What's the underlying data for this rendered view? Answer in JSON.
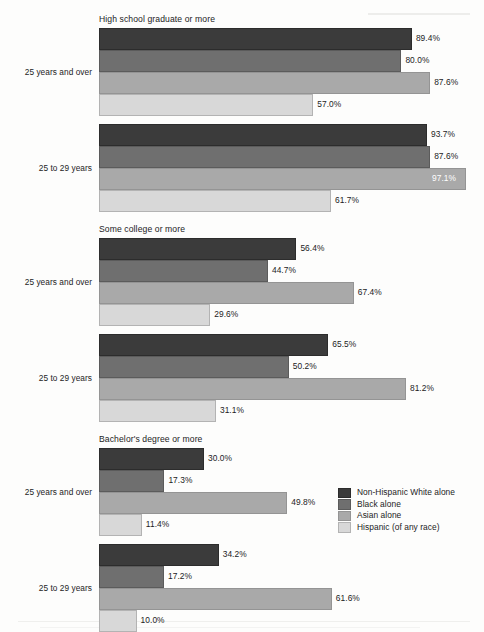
{
  "chart_data": {
    "type": "bar",
    "orientation": "horizontal",
    "title": "",
    "xlabel": "",
    "ylabel": "",
    "grid": false,
    "legend_position": "bottom-right",
    "value_suffix": "%",
    "xlim": [
      0,
      100
    ],
    "legend": [
      "Non-Hispanic White alone",
      "Black alone",
      "Asian alone",
      "Hispanic (of any race)"
    ],
    "series_colors": [
      "#3b3b3b",
      "#6f6f6f",
      "#a9a9a9",
      "#d8d8d8"
    ],
    "panels": [
      {
        "title": "High school graduate or more",
        "groups": [
          {
            "label": "25 years and over",
            "categories": [
              "Non-Hispanic White alone",
              "Black alone",
              "Asian alone",
              "Hispanic (of any race)"
            ],
            "values": [
              89.4,
              80.0,
              87.6,
              57.0
            ],
            "labels": [
              "89.4%",
              "80.0%",
              "87.6%",
              "57.0%"
            ]
          },
          {
            "label": "25 to 29 years",
            "categories": [
              "Non-Hispanic White alone",
              "Black alone",
              "Asian alone",
              "Hispanic (of any race)"
            ],
            "values": [
              93.7,
              87.6,
              97.1,
              61.7
            ],
            "labels": [
              "93.7%",
              "87.6%",
              "97.1%",
              "61.7%"
            ]
          }
        ]
      },
      {
        "title": "Some college or more",
        "groups": [
          {
            "label": "25 years and over",
            "categories": [
              "Non-Hispanic White alone",
              "Black alone",
              "Asian alone",
              "Hispanic (of any race)"
            ],
            "values": [
              56.4,
              44.7,
              67.4,
              29.6
            ],
            "labels": [
              "56.4%",
              "44.7%",
              "67.4%",
              "29.6%"
            ]
          },
          {
            "label": "25 to 29 years",
            "categories": [
              "Non-Hispanic White alone",
              "Black alone",
              "Asian alone",
              "Hispanic (of any race)"
            ],
            "values": [
              65.5,
              50.2,
              81.2,
              31.1
            ],
            "labels": [
              "65.5%",
              "50.2%",
              "81.2%",
              "31.1%"
            ]
          }
        ]
      },
      {
        "title": "Bachelor's degree or more",
        "groups": [
          {
            "label": "25 years and over",
            "categories": [
              "Non-Hispanic White alone",
              "Black alone",
              "Asian alone",
              "Hispanic (of any race)"
            ],
            "values": [
              30.0,
              17.3,
              49.8,
              11.4
            ],
            "labels": [
              "30.0%",
              "17.3%",
              "49.8%",
              "11.4%"
            ]
          },
          {
            "label": "25 to 29 years",
            "categories": [
              "Non-Hispanic White alone",
              "Black alone",
              "Asian alone",
              "Hispanic (of any race)"
            ],
            "values": [
              34.2,
              17.2,
              61.6,
              10.0
            ],
            "labels": [
              "34.2%",
              "17.2%",
              "61.6%",
              "10.0%"
            ]
          }
        ]
      }
    ]
  }
}
